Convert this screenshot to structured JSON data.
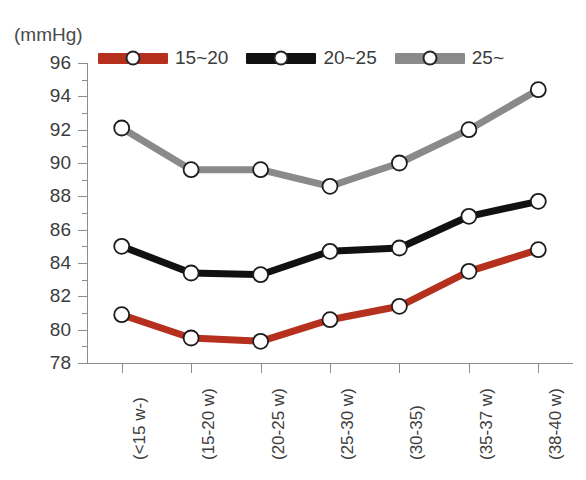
{
  "chart_data": {
    "type": "line",
    "title": "",
    "subtitle": "",
    "unit_label": "(mmHg)",
    "xlabel": "",
    "ylabel": "",
    "ylim": [
      78,
      96
    ],
    "ytick_step": 2,
    "yticks": [
      78,
      80,
      82,
      84,
      86,
      88,
      90,
      92,
      94,
      96
    ],
    "minor_ticks": true,
    "grid": false,
    "legend_position": "top",
    "categories": [
      "(<15 w-)",
      "(15-20 w)",
      "(20-25 w)",
      "(25-30 w)",
      "(30-35)",
      "(35-37 w)",
      "(38-40 w)"
    ],
    "series": [
      {
        "name": "15~20",
        "color": "#b5311d",
        "values": [
          80.9,
          79.5,
          79.3,
          80.6,
          81.4,
          83.5,
          84.8
        ]
      },
      {
        "name": "20~25",
        "color": "#111111",
        "values": [
          85.0,
          83.4,
          83.3,
          84.7,
          84.9,
          86.8,
          87.7
        ]
      },
      {
        "name": "25~",
        "color": "#8a8a8a",
        "values": [
          92.1,
          89.6,
          89.6,
          88.6,
          90.0,
          92.0,
          94.4
        ]
      }
    ]
  },
  "legend": {
    "items": [
      {
        "label": "15~20",
        "color": "#b5311d"
      },
      {
        "label": "20~25",
        "color": "#111111"
      },
      {
        "label": "25~",
        "color": "#8a8a8a"
      }
    ]
  },
  "axis": {
    "unit": "(mmHg)",
    "y_labels": [
      "96",
      "94",
      "92",
      "90",
      "88",
      "86",
      "84",
      "82",
      "80",
      "78"
    ],
    "x_labels": [
      "(<15 w-)",
      "(15-20 w)",
      "(20-25 w)",
      "(25-30 w)",
      "(30-35)",
      "(35-37 w)",
      "(38-40 w)"
    ]
  }
}
